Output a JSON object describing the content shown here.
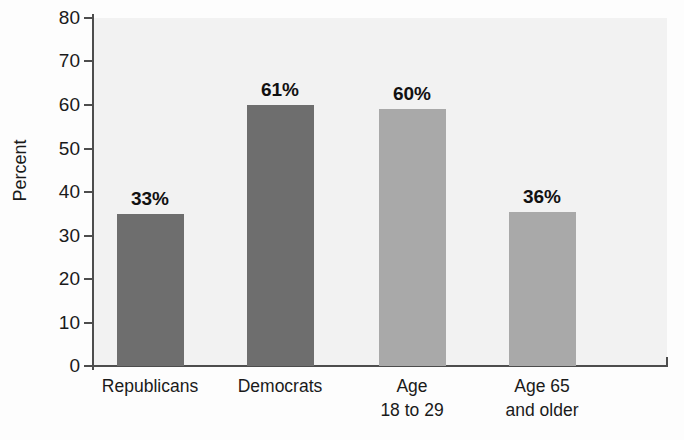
{
  "chart_data": {
    "type": "bar",
    "title": "",
    "subtitle": "",
    "xlabel": "",
    "ylabel": "Percent",
    "ylim": [
      0,
      80
    ],
    "ytick_step": 10,
    "yticks": [
      80,
      70,
      60,
      50,
      40,
      30,
      20,
      10,
      0
    ],
    "grid": false,
    "legend": null,
    "categories": [
      "Republicans",
      "Democrats",
      "Age 18 to 29",
      "Age 65 and older"
    ],
    "category_lines": [
      [
        "Republicans"
      ],
      [
        "Democrats"
      ],
      [
        "Age",
        "18 to 29"
      ],
      [
        "Age 65",
        "and older"
      ]
    ],
    "values": [
      33,
      61,
      60,
      36
    ],
    "value_labels": [
      "33%",
      "61%",
      "60%",
      "36%"
    ],
    "bar_colors": [
      "#6e6e6e",
      "#6e6e6e",
      "#a9a9a9",
      "#a9a9a9"
    ],
    "plot_background": "#f1f1f1",
    "axis_color": "#4d4d4d",
    "text_color": "#1a1a1a"
  }
}
